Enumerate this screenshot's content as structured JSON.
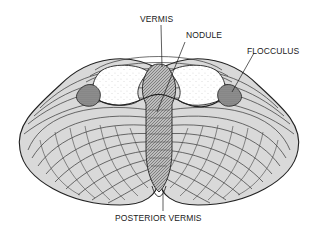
{
  "diagram": {
    "labels": {
      "vermis": "VERMIS",
      "nodule": "NODULE",
      "flocculus": "FLOCCULUS",
      "posterior_vermis": "POSTERIOR VERMIS"
    },
    "colors": {
      "ink": "#1a1a1a",
      "shade": "#8a8a8a",
      "background": "#ffffff"
    }
  }
}
